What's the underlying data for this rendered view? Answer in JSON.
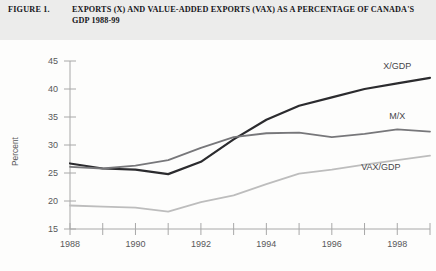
{
  "figure": {
    "label": "FIGURE 1.",
    "title": "EXPORTS (X) AND VALUE-ADDED EXPORTS (VAX) AS A PERCENTAGE OF CANADA'S GDP 1988-99"
  },
  "colors": {
    "x_gdp": "#2b2b2e",
    "m_x": "#77777a",
    "vax_gdp": "#bdbdbd",
    "axis": "#9a9a9a",
    "tick_text": "#58585a",
    "title_text": "#16161a",
    "page_background": "#f2f2f0",
    "plot_background": "#fdfdfc"
  },
  "axes": {
    "y_title": "Percent",
    "y_ticks": [
      "15",
      "20",
      "25",
      "30",
      "35",
      "40",
      "45"
    ],
    "y_min": 15,
    "y_max": 45,
    "x_ticks_visible": [
      "1988",
      "1990",
      "1992",
      "1994",
      "1996",
      "1998"
    ],
    "x_min": 1988,
    "x_max": 1999,
    "grid": false
  },
  "series_labels": {
    "x_gdp": "X/GDP",
    "m_x": "M/X",
    "vax_gdp": "VAX/GDP"
  },
  "chart_data": {
    "type": "line",
    "title": "EXPORTS (X) AND VALUE-ADDED EXPORTS (VAX) AS A PERCENTAGE OF CANADA'S GDP 1988-99",
    "xlabel": "",
    "ylabel": "Percent",
    "xlim": [
      1988,
      1999
    ],
    "ylim": [
      15,
      45
    ],
    "grid": false,
    "legend_position": "inline-right",
    "x": [
      1988,
      1989,
      1990,
      1991,
      1992,
      1993,
      1994,
      1995,
      1996,
      1997,
      1998,
      1999
    ],
    "xtick_labels": [
      "1988",
      "1990",
      "1992",
      "1994",
      "1996",
      "1998"
    ],
    "ytick_labels": [
      "15",
      "20",
      "25",
      "30",
      "35",
      "40",
      "45"
    ],
    "series": [
      {
        "name": "X/GDP",
        "color": "#2b2b2e",
        "values": [
          26.7,
          25.8,
          25.6,
          24.8,
          27.0,
          31.0,
          34.5,
          37.0,
          38.5,
          40.0,
          41.0,
          42.0
        ]
      },
      {
        "name": "M/X",
        "color": "#77777a",
        "values": [
          26.1,
          25.8,
          26.3,
          27.3,
          29.5,
          31.4,
          32.1,
          32.2,
          31.4,
          32.0,
          32.8,
          32.4
        ]
      },
      {
        "name": "VAX/GDP",
        "color": "#bdbdbd",
        "values": [
          19.2,
          19.0,
          18.8,
          18.1,
          19.8,
          21.0,
          23.0,
          24.9,
          25.6,
          26.5,
          27.3,
          28.1
        ]
      }
    ],
    "annotations": [
      {
        "text": "X/GDP",
        "x": 1998.0,
        "y": 43.6
      },
      {
        "text": "M/X",
        "x": 1998.0,
        "y": 34.7
      },
      {
        "text": "VAX/GDP",
        "x": 1997.5,
        "y": 25.6
      }
    ]
  }
}
